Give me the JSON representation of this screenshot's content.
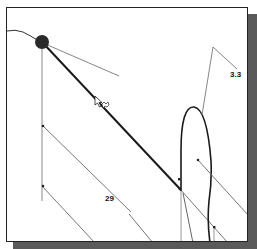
{
  "drawing": {
    "labels": {
      "dimension_1": "3.3",
      "dimension_2": "29"
    },
    "colors": {
      "frame_border": "#222222",
      "shadow": "#5a5a5a",
      "thick_line": "#1a1a1a",
      "thin_line": "#707070",
      "node_fill": "#2a2a2a"
    },
    "icons": {
      "cursor": "drag-cursor-icon",
      "node": "selected-point-icon"
    }
  }
}
